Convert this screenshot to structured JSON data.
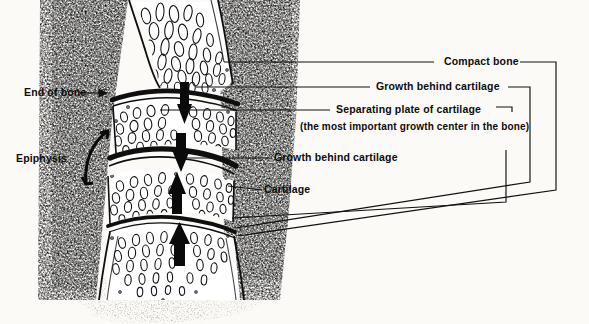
{
  "figure": {
    "kind": "anatomical-line-drawing",
    "background_color": "#fbfaf7",
    "ink_color": "#111111"
  },
  "labels": {
    "compact_bone": "Compact bone",
    "growth_behind_cartilage_upper": "Growth behind cartilage",
    "separating_plate": "Separating plate of cartilage",
    "separating_plate_note": "(the most important growth center in the bone)",
    "growth_behind_cartilage_lower": "Growth behind cartilage",
    "cartilage": "Cartilage",
    "end_of_bone": "End of bone",
    "epiphysis": "Epiphysis"
  },
  "icons": {
    "arrow_right": "arrow-right-icon",
    "arrow_down": "arrow-down-icon",
    "arrow_up": "arrow-up-icon",
    "bracket": "epiphysis-bracket-icon"
  },
  "arrows": [
    {
      "name": "growth-arrow-1",
      "direction": "down"
    },
    {
      "name": "growth-arrow-2",
      "direction": "down"
    },
    {
      "name": "growth-arrow-3",
      "direction": "up"
    },
    {
      "name": "growth-arrow-4",
      "direction": "up"
    }
  ]
}
